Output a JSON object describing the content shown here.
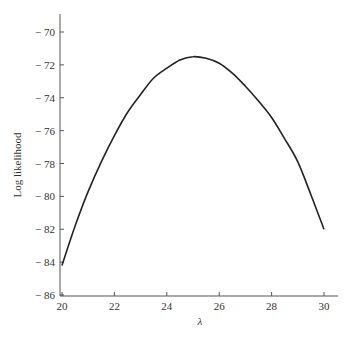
{
  "chart_data": {
    "type": "line",
    "title": "",
    "xlabel": "λ",
    "ylabel": "Log likelihood",
    "xlim": [
      20,
      30
    ],
    "ylim": [
      -86,
      -70
    ],
    "xticks": [
      20,
      22,
      24,
      26,
      28,
      30
    ],
    "yticks": [
      -70,
      -72,
      -74,
      -76,
      -78,
      -80,
      -82,
      -84,
      -86
    ],
    "xtick_labels": [
      "20",
      "22",
      "24",
      "26",
      "28",
      "30"
    ],
    "ytick_labels": [
      "− 70",
      "− 72",
      "− 74",
      "− 76",
      "− 78",
      "− 80",
      "− 82",
      "− 84",
      "− 86"
    ],
    "grid": false,
    "legend": null,
    "series": [
      {
        "name": "log-likelihood",
        "x": [
          20,
          20.5,
          21,
          21.5,
          22,
          22.5,
          23,
          23.5,
          24,
          24.5,
          25,
          25.5,
          26,
          26.5,
          27,
          27.5,
          28,
          28.5,
          29,
          29.5,
          30
        ],
        "y": [
          -84.2,
          -81.8,
          -79.7,
          -77.9,
          -76.3,
          -74.9,
          -73.8,
          -72.8,
          -72.2,
          -71.7,
          -71.5,
          -71.6,
          -71.9,
          -72.5,
          -73.3,
          -74.2,
          -75.2,
          -76.5,
          -77.9,
          -79.9,
          -82.0
        ]
      }
    ]
  },
  "labels": {
    "xlabel": "λ",
    "ylabel": "Log likelihood"
  }
}
